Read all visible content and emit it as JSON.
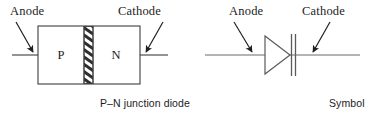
{
  "figure": {
    "stroke_color": "#3d3d3d",
    "text_color": "#1c1c1c",
    "background": "#ffffff"
  },
  "diagrams": [
    {
      "id": "pn-junction-diode",
      "caption": "P–N junction diode",
      "labels": {
        "anode": "Anode",
        "cathode": "Cathode"
      },
      "regions": [
        {
          "name": "p-region",
          "label": "P"
        },
        {
          "name": "n-region",
          "label": "N"
        },
        {
          "name": "junction",
          "label": ""
        }
      ]
    },
    {
      "id": "diode-symbol",
      "caption": "Symbol",
      "labels": {
        "anode": "Anode",
        "cathode": "Cathode"
      }
    }
  ]
}
